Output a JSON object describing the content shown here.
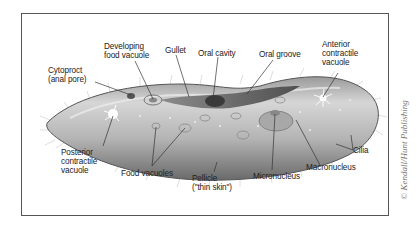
{
  "figure": {
    "labels": {
      "cytoproct": "Cytoproct\n(anal pore)",
      "developing_food_vacuole": "Developing\nfood vacuole",
      "gullet": "Gullet",
      "oral_cavity": "Oral cavity",
      "oral_groove": "Oral groove",
      "anterior_contractile_vacuole": "Anterior\ncontractile\nvacuole",
      "posterior_contractile_vacuole": "Posterior\ncontractile\nvacuole",
      "food_vacuoles": "Food vacuoles",
      "pellicle": "Pellicle\n(\"thin skin\")",
      "micronucleus": "Micronucleus",
      "macronucleus": "Macronucleus",
      "cilia": "Cilia"
    },
    "copyright": "© Kendall/Hunt Publishing"
  },
  "colors": {
    "frame": "#555555",
    "body_light": "#c8c8c8",
    "body_dark": "#6e6e6e",
    "leader_line": "#333333",
    "text": "#222222"
  }
}
